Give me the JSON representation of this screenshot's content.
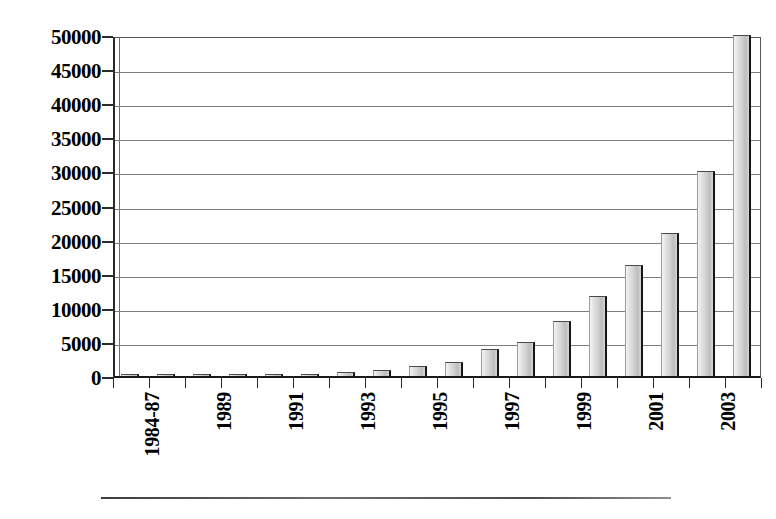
{
  "chart_data": {
    "type": "bar",
    "title": "",
    "subtitle": "",
    "xlabel": "",
    "ylabel": "",
    "ylim": [
      0,
      50000
    ],
    "ytick_step": 5000,
    "grid": true,
    "legend": null,
    "orientation": "vertical",
    "xtick_rotation_degrees": 90,
    "categories": [
      "1984-87",
      "1988",
      "1989",
      "1990",
      "1991",
      "1992",
      "1993",
      "1994",
      "1995",
      "1996",
      "1997",
      "1998",
      "1999",
      "2000",
      "2001",
      "2002",
      "2003",
      "2004"
    ],
    "visible_tick_labels": [
      "1984-87",
      "",
      "1989",
      "",
      "1991",
      "",
      "1993",
      "",
      "1995",
      "",
      "1997",
      "",
      "1999",
      "",
      "2001",
      "",
      "2003",
      ""
    ],
    "values": [
      150,
      160,
      180,
      200,
      250,
      280,
      600,
      900,
      1400,
      2100,
      4000,
      5000,
      8000,
      11800,
      16300,
      21000,
      30000,
      50000
    ],
    "ytick_labels": [
      "0",
      "5000",
      "10000",
      "15000",
      "20000",
      "25000",
      "30000",
      "35000",
      "40000",
      "45000",
      "50000"
    ],
    "ytick_values": [
      0,
      5000,
      10000,
      15000,
      20000,
      25000,
      30000,
      35000,
      40000,
      45000,
      50000
    ],
    "colors": {
      "bar_face_light": "#f4f4f4",
      "bar_face_mid": "#cfcfcf",
      "bar_edge_dark": "#161616",
      "gridline": "#7c7c7c",
      "axis": "#2b2b2b",
      "background": "#ffffff",
      "text": "#000000"
    }
  },
  "figure": {
    "bottom_rule_visible": true
  }
}
